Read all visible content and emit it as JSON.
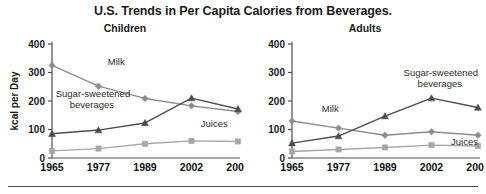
{
  "title": "U.S. Trends in Per Capita Calories from Beverages.",
  "ylabel": "kcal per Day",
  "panels": [
    {
      "key": "children",
      "title": "Children"
    },
    {
      "key": "adults",
      "title": "Adults"
    }
  ],
  "labels": {
    "milk": "Milk",
    "ssb_line1": "Sugar-sweetened",
    "ssb_line2": "beverages",
    "juices": "Juices"
  },
  "colors": {
    "milk": "#8c8c8c",
    "ssb": "#4d4d4d",
    "juices": "#a6a6a6",
    "axis": "#4d4d4d",
    "text": "#1a1a1a"
  },
  "chart_data": [
    {
      "type": "line",
      "title": "Children",
      "suptitle": "U.S. Trends in Per Capita Calories from Beverages.",
      "xlabel": "",
      "ylabel": "kcal per Day",
      "categories": [
        "1965",
        "1977",
        "1989",
        "2002",
        "2006"
      ],
      "x": [
        1965,
        1977,
        1989,
        2002,
        2006
      ],
      "ylim": [
        0,
        400
      ],
      "yticks": [
        0,
        100,
        200,
        300,
        400
      ],
      "grid": false,
      "legend": "inline-annotations",
      "series": [
        {
          "name": "Milk",
          "marker": "diamond",
          "color": "#8c8c8c",
          "values": [
            325,
            252,
            209,
            183,
            163
          ]
        },
        {
          "name": "Sugar-sweetened beverages",
          "marker": "triangle",
          "color": "#4d4d4d",
          "values": [
            85,
            98,
            123,
            210,
            172
          ]
        },
        {
          "name": "Juices",
          "marker": "square",
          "color": "#a6a6a6",
          "values": [
            25,
            33,
            50,
            60,
            58
          ]
        }
      ]
    },
    {
      "type": "line",
      "title": "Adults",
      "suptitle": "U.S. Trends in Per Capita Calories from Beverages.",
      "xlabel": "",
      "ylabel": "kcal per Day",
      "categories": [
        "1965",
        "1977",
        "1989",
        "2002",
        "2006"
      ],
      "x": [
        1965,
        1977,
        1989,
        2002,
        2006
      ],
      "ylim": [
        0,
        400
      ],
      "yticks": [
        0,
        100,
        200,
        300,
        400
      ],
      "grid": false,
      "legend": "inline-annotations",
      "series": [
        {
          "name": "Milk",
          "marker": "diamond",
          "color": "#8c8c8c",
          "values": [
            130,
            105,
            80,
            92,
            80
          ]
        },
        {
          "name": "Sugar-sweetened beverages",
          "marker": "triangle",
          "color": "#4d4d4d",
          "values": [
            52,
            77,
            147,
            210,
            177
          ]
        },
        {
          "name": "Juices",
          "marker": "square",
          "color": "#a6a6a6",
          "values": [
            23,
            30,
            37,
            45,
            42
          ]
        }
      ]
    }
  ]
}
